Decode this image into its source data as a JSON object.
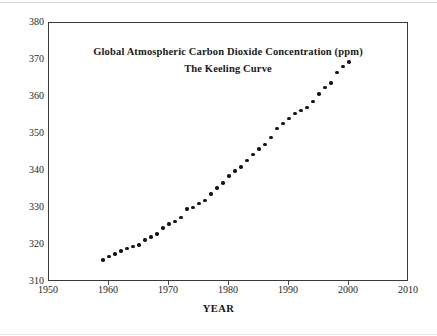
{
  "chart_data": {
    "type": "scatter",
    "title": "Global Atmospheric Carbon Dioxide Concentration (ppm)",
    "subtitle": "The Keeling Curve",
    "xlabel": "YEAR",
    "ylabel": "",
    "xlim": [
      1950,
      2010
    ],
    "ylim": [
      310,
      380
    ],
    "grid": false,
    "legend": false,
    "xticks": [
      1950,
      1960,
      1970,
      1980,
      1990,
      2000,
      2010
    ],
    "yticks": [
      310,
      320,
      330,
      340,
      350,
      360,
      370,
      380
    ],
    "marker_color": "#151515",
    "axis_color": "#3a3a3a",
    "series": [
      {
        "name": "Atmospheric CO2 concentration (ppm)",
        "x": [
          1959,
          1960,
          1961,
          1962,
          1963,
          1964,
          1965,
          1966,
          1967,
          1968,
          1969,
          1970,
          1971,
          1972,
          1973,
          1974,
          1975,
          1976,
          1977,
          1978,
          1979,
          1980,
          1981,
          1982,
          1983,
          1984,
          1985,
          1986,
          1987,
          1988,
          1989,
          1990,
          1991,
          1992,
          1993,
          1994,
          1995,
          1996,
          1997,
          1998,
          1999,
          2000
        ],
        "values": [
          316.0,
          316.9,
          317.6,
          318.4,
          319.0,
          319.6,
          320.0,
          321.4,
          322.2,
          323.0,
          324.6,
          325.7,
          326.3,
          327.5,
          329.7,
          330.2,
          331.2,
          332.1,
          333.8,
          335.4,
          336.8,
          338.7,
          340.0,
          341.1,
          342.8,
          344.4,
          345.9,
          347.2,
          349.0,
          351.5,
          352.9,
          354.2,
          355.6,
          356.4,
          357.1,
          358.8,
          360.8,
          362.6,
          363.8,
          366.6,
          368.3,
          369.5
        ]
      }
    ]
  }
}
